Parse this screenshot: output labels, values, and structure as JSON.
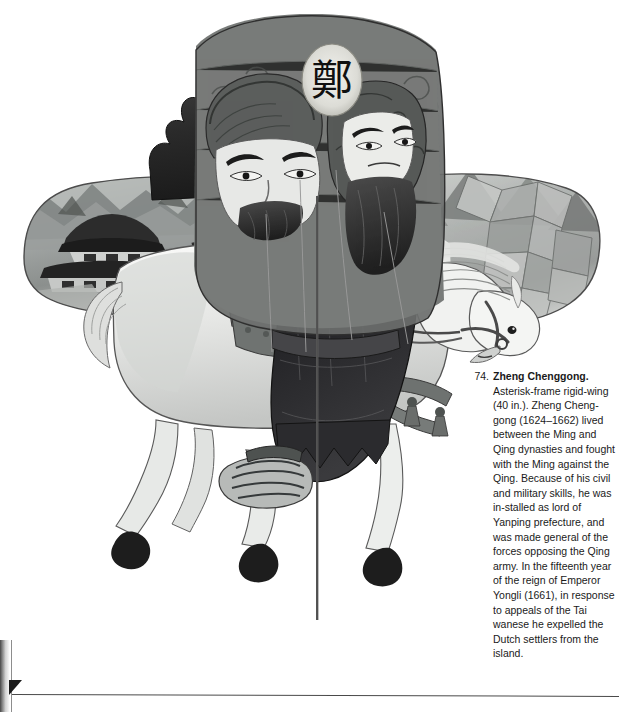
{
  "page": {
    "background_color": "#ffffff",
    "ink_color": "#1a1a1a"
  },
  "caption": {
    "number": "74.",
    "title": "Zheng Chenggong.",
    "text": " Asterisk-frame rigid-wing (40 in.). Zheng Cheng-gong  (1624–1662) lived between the Ming and Qing dynasties and fought with the Ming against the Qing. Because of his civil and military skills, he was in-stalled as lord of Yanping prefecture, and was made general of the forces opposing the Qing army. In the fifteenth year of  the reign of Emperor Yongli (1661), in response to appeals of the Tai wanese he expelled the Dutch settlers from the island.",
    "lines": [
      "Asterisk-frame rigid-",
      "wing (40 in.). Zheng",
      "Cheng-gong  (1624–",
      "1662) lived between",
      "the Ming and Qing",
      "dynasties and fought",
      "with the Ming against",
      "the Qing. Because of",
      "his civil and military",
      "skills, he was in-",
      "stalled as lord of",
      "Yanping prefecture,",
      "and was made",
      "general of the forces",
      "opposing the Qing",
      "army. In the fifteenth",
      "year of  the reign of",
      "Emperor Yongli",
      "(1661), in response to",
      "appeals of the Tai",
      "wanese he expelled",
      "the Dutch settlers from",
      "the island."
    ]
  },
  "figure": {
    "name": "zheng-chenggong-kite-photograph",
    "seal_character": "鄭",
    "left_wing_scene": "fortress walls, pagoda roofs, mountains and clouds",
    "right_wing_scene": "faceted mountain peaks behind the horse's head",
    "palette": {
      "ink_dark": "#1d1d1d",
      "mid_grey": "#6f6f6f",
      "light_grey": "#bdbdbd",
      "paper_white": "#f7f7f5"
    }
  }
}
